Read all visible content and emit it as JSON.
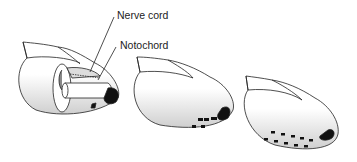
{
  "diagram": {
    "labels": {
      "nerve_cord": "Nerve cord",
      "notochord": "Notochord"
    },
    "figures": [
      {
        "id": "stage-1",
        "description": "cut-away head showing nerve cord and notochord"
      },
      {
        "id": "stage-2",
        "description": "head with developing gill slits"
      },
      {
        "id": "stage-3",
        "description": "head with rows of gill slits"
      }
    ],
    "colors": {
      "line": "#222222",
      "fill": "#ffffff",
      "shade": "#d8d8d8",
      "dark": "#111111"
    }
  }
}
